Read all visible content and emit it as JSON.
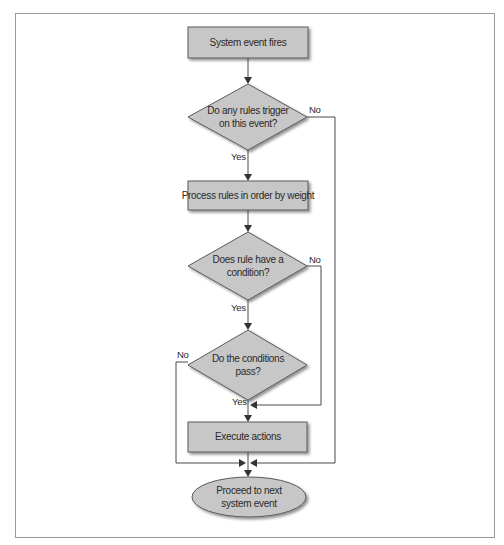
{
  "diagram": {
    "type": "flowchart",
    "colors": {
      "shape_fill": "#c7c7c7",
      "shape_stroke": "#5a5a5a",
      "connector": "#4a4a4a",
      "frame_border": "#9a9a9a",
      "background": "#ffffff"
    },
    "nodes": {
      "start": {
        "shape": "rectangle",
        "lines": [
          "System event fires"
        ]
      },
      "decision_trigger": {
        "shape": "diamond",
        "lines": [
          "Do any rules trigger",
          "on this event?"
        ]
      },
      "process_rules": {
        "shape": "rectangle",
        "lines": [
          "Process rules in order by weight"
        ]
      },
      "decision_condition": {
        "shape": "diamond",
        "lines": [
          "Does rule have a",
          "condition?"
        ]
      },
      "decision_pass": {
        "shape": "diamond",
        "lines": [
          "Do the conditions",
          "pass?"
        ]
      },
      "execute": {
        "shape": "rectangle",
        "lines": [
          "Execute actions"
        ]
      },
      "end": {
        "shape": "ellipse",
        "lines": [
          "Proceed to next",
          "system event"
        ]
      }
    },
    "edge_labels": {
      "trigger_yes": "Yes",
      "trigger_no": "No",
      "condition_yes": "Yes",
      "condition_no": "No",
      "pass_yes": "Yes",
      "pass_no": "No"
    },
    "edges": [
      {
        "from": "start",
        "to": "decision_trigger",
        "label": ""
      },
      {
        "from": "decision_trigger",
        "to": "process_rules",
        "label": "Yes"
      },
      {
        "from": "decision_trigger",
        "to": "end",
        "label": "No"
      },
      {
        "from": "process_rules",
        "to": "decision_condition",
        "label": ""
      },
      {
        "from": "decision_condition",
        "to": "decision_pass",
        "label": "Yes"
      },
      {
        "from": "decision_condition",
        "to": "execute",
        "label": "No"
      },
      {
        "from": "decision_pass",
        "to": "execute",
        "label": "Yes"
      },
      {
        "from": "decision_pass",
        "to": "end",
        "label": "No"
      },
      {
        "from": "execute",
        "to": "end",
        "label": ""
      }
    ]
  }
}
